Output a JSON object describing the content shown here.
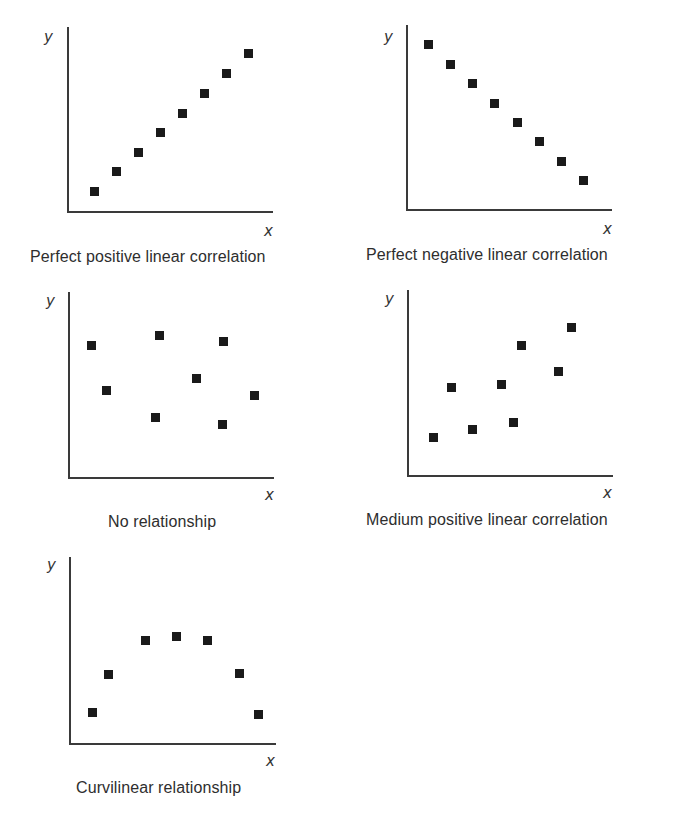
{
  "figure": {
    "panels": [
      {
        "id": "perfect-positive",
        "caption": "Perfect positive linear correlation",
        "y_label": "y",
        "x_label": "x",
        "axis": {
          "x0": 68,
          "y_top": 27,
          "y0": 212,
          "x_end": 273
        },
        "y_label_pos": [
          44,
          42
        ],
        "x_label_pos": [
          264,
          236
        ],
        "caption_pos": [
          30,
          248
        ],
        "points": [
          [
            94,
            191
          ],
          [
            116,
            171
          ],
          [
            138,
            152
          ],
          [
            160,
            132
          ],
          [
            182,
            113
          ],
          [
            204,
            93
          ],
          [
            226,
            73
          ],
          [
            248,
            53
          ]
        ]
      },
      {
        "id": "perfect-negative",
        "caption": "Perfect negative linear correlation",
        "y_label": "y",
        "x_label": "x",
        "axis": {
          "x0": 407,
          "y_top": 25,
          "y0": 210,
          "x_end": 612
        },
        "y_label_pos": [
          384,
          42
        ],
        "x_label_pos": [
          603,
          234
        ],
        "caption_pos": [
          366,
          246
        ],
        "points": [
          [
            428,
            44
          ],
          [
            450,
            64
          ],
          [
            472,
            83
          ],
          [
            494,
            103
          ],
          [
            517,
            122
          ],
          [
            539,
            141
          ],
          [
            561,
            161
          ],
          [
            583,
            180
          ]
        ]
      },
      {
        "id": "no-relationship",
        "caption": "No relationship",
        "y_label": "y",
        "x_label": "x",
        "axis": {
          "x0": 69,
          "y_top": 292,
          "y0": 478,
          "x_end": 274
        },
        "y_label_pos": [
          46,
          306
        ],
        "x_label_pos": [
          265,
          500
        ],
        "caption_pos": [
          108,
          513
        ],
        "points": [
          [
            91,
            345
          ],
          [
            106,
            390
          ],
          [
            159,
            335
          ],
          [
            155,
            417
          ],
          [
            196,
            378
          ],
          [
            223,
            341
          ],
          [
            222,
            424
          ],
          [
            254,
            395
          ]
        ]
      },
      {
        "id": "medium-positive",
        "caption": "Medium positive linear correlation",
        "y_label": "y",
        "x_label": "x",
        "axis": {
          "x0": 408,
          "y_top": 290,
          "y0": 476,
          "x_end": 613
        },
        "y_label_pos": [
          385,
          304
        ],
        "x_label_pos": [
          603,
          498
        ],
        "caption_pos": [
          366,
          511
        ],
        "points": [
          [
            433,
            437
          ],
          [
            451,
            387
          ],
          [
            472,
            429
          ],
          [
            501,
            384
          ],
          [
            513,
            422
          ],
          [
            521,
            345
          ],
          [
            558,
            371
          ],
          [
            571,
            327
          ]
        ]
      },
      {
        "id": "curvilinear",
        "caption": "Curvilinear relationship",
        "y_label": "y",
        "x_label": "x",
        "axis": {
          "x0": 70,
          "y_top": 557,
          "y0": 744,
          "x_end": 276
        },
        "y_label_pos": [
          47,
          570
        ],
        "x_label_pos": [
          266,
          766
        ],
        "caption_pos": [
          76,
          779
        ],
        "points": [
          [
            92,
            712
          ],
          [
            108,
            674
          ],
          [
            145,
            640
          ],
          [
            176,
            636
          ],
          [
            207,
            640
          ],
          [
            239,
            673
          ],
          [
            258,
            714
          ]
        ]
      }
    ]
  },
  "chart_data": [
    {
      "type": "scatter",
      "title": "Perfect positive linear correlation",
      "xlabel": "x",
      "ylabel": "y",
      "x": [
        1,
        2,
        3,
        4,
        5,
        6,
        7,
        8
      ],
      "y": [
        1,
        2,
        3,
        4,
        5,
        6,
        7,
        8
      ]
    },
    {
      "type": "scatter",
      "title": "Perfect negative linear correlation",
      "xlabel": "x",
      "ylabel": "y",
      "x": [
        1,
        2,
        3,
        4,
        5,
        6,
        7,
        8
      ],
      "y": [
        8,
        7,
        6,
        5,
        4,
        3,
        2,
        1
      ]
    },
    {
      "type": "scatter",
      "title": "No relationship",
      "xlabel": "x",
      "ylabel": "y",
      "x": [
        1,
        2,
        4.5,
        4.3,
        6.2,
        7.4,
        7.4,
        8.8
      ],
      "y": [
        7.1,
        4.7,
        7.6,
        3.2,
        5.3,
        7.2,
        2.9,
        4.4
      ]
    },
    {
      "type": "scatter",
      "title": "Medium positive linear correlation",
      "xlabel": "x",
      "ylabel": "y",
      "x": [
        1,
        1.8,
        2.8,
        4.1,
        4.6,
        5,
        6.6,
        7.2
      ],
      "y": [
        2,
        4.7,
        2.5,
        4.9,
        2.8,
        7,
        5.6,
        8
      ]
    },
    {
      "type": "scatter",
      "title": "Curvilinear relationship",
      "xlabel": "x",
      "ylabel": "y",
      "x": [
        1,
        1.7,
        3.3,
        4.7,
        6.1,
        7.5,
        8.4
      ],
      "y": [
        1.7,
        3.7,
        5.5,
        5.7,
        5.5,
        3.7,
        1.6
      ]
    }
  ]
}
